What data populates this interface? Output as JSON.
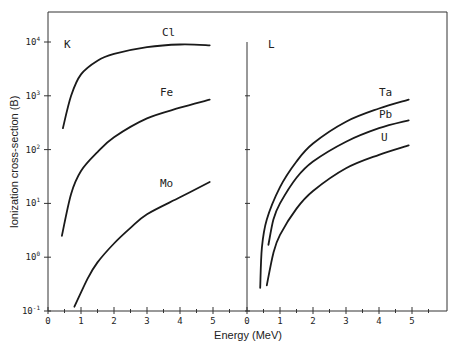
{
  "chart_data": {
    "type": "line",
    "title": "",
    "xlabel": "Energy (MeV)",
    "ylabel": "Ionization cross-section (B)",
    "yscale": "log",
    "ylim": [
      0.1,
      40000
    ],
    "yticks": [
      {
        "base": "10",
        "exp": "4",
        "value": 10000
      },
      {
        "base": "10",
        "exp": "3",
        "value": 1000
      },
      {
        "base": "10",
        "exp": "2",
        "value": 100
      },
      {
        "base": "10",
        "exp": "1",
        "value": 10
      },
      {
        "base": "10",
        "exp": "0",
        "value": 1
      },
      {
        "base": "10",
        "exp": "-1",
        "value": 0.1
      }
    ],
    "xticks": [
      "0",
      "1",
      "2",
      "3",
      "4",
      "5"
    ],
    "grid": false,
    "panels": [
      {
        "label": "K",
        "xlim": [
          0,
          6
        ],
        "series": [
          {
            "name": "Cl",
            "points": [
              [
                0.45,
                250
              ],
              [
                0.7,
                1000
              ],
              [
                1.0,
                2500
              ],
              [
                1.5,
                4500
              ],
              [
                2.0,
                6000
              ],
              [
                3.0,
                8000
              ],
              [
                4.0,
                9000
              ],
              [
                4.9,
                8700
              ]
            ]
          },
          {
            "name": "Fe",
            "points": [
              [
                0.42,
                2.5
              ],
              [
                0.7,
                15
              ],
              [
                1.0,
                40
              ],
              [
                1.5,
                90
              ],
              [
                2.0,
                170
              ],
              [
                3.0,
                380
              ],
              [
                4.0,
                600
              ],
              [
                4.9,
                850
              ]
            ]
          },
          {
            "name": "Mo",
            "points": [
              [
                0.8,
                0.12
              ],
              [
                1.2,
                0.4
              ],
              [
                1.5,
                0.8
              ],
              [
                2.0,
                1.8
              ],
              [
                2.5,
                3.5
              ],
              [
                3.0,
                6.3
              ],
              [
                4.0,
                13
              ],
              [
                4.9,
                25
              ]
            ]
          }
        ]
      },
      {
        "label": "L",
        "xlim": [
          0,
          6
        ],
        "series": [
          {
            "name": "Ta",
            "points": [
              [
                0.4,
                0.27
              ],
              [
                0.45,
                1.5
              ],
              [
                0.6,
                5
              ],
              [
                1.0,
                20
              ],
              [
                1.5,
                60
              ],
              [
                2.0,
                130
              ],
              [
                3.0,
                330
              ],
              [
                4.0,
                580
              ],
              [
                4.9,
                850
              ]
            ]
          },
          {
            "name": "Pb",
            "points": [
              [
                0.65,
                1.7
              ],
              [
                0.8,
                5
              ],
              [
                1.0,
                10
              ],
              [
                1.5,
                30
              ],
              [
                2.0,
                60
              ],
              [
                3.0,
                140
              ],
              [
                4.0,
                250
              ],
              [
                4.9,
                350
              ]
            ]
          },
          {
            "name": "U",
            "points": [
              [
                0.6,
                0.3
              ],
              [
                0.8,
                1.2
              ],
              [
                1.0,
                2.6
              ],
              [
                1.5,
                8
              ],
              [
                2.0,
                17
              ],
              [
                3.0,
                45
              ],
              [
                4.0,
                80
              ],
              [
                4.9,
                120
              ]
            ]
          }
        ]
      }
    ]
  }
}
